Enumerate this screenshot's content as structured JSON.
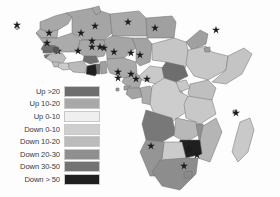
{
  "figure": {
    "type": "choropleth-map",
    "region": "Africa",
    "background_color": "#fdfdfd",
    "border_color": "#6e6e6e",
    "marker_color": "#1a1a1a"
  },
  "legend": {
    "name": "map-legend",
    "position": "lower-left",
    "entries": [
      {
        "label": "Up >20",
        "color": "#6e6e6e"
      },
      {
        "label": "Up 10-20",
        "color": "#a8a8a8"
      },
      {
        "label": "Up 0-10",
        "color": "#efefef"
      },
      {
        "label": "Down 0-10",
        "color": "#cfcfcf"
      },
      {
        "label": "Down 10-20",
        "color": "#bbbbbb"
      },
      {
        "label": "Down 20-30",
        "color": "#8f8f8f"
      },
      {
        "label": "Down 30-50",
        "color": "#737373"
      },
      {
        "label": "Down > 50",
        "color": "#1f1f1f"
      }
    ]
  },
  "chart_data": {
    "type": "heatmap",
    "title": "",
    "xlabel": "",
    "ylabel": "",
    "legend_position": "lower-left",
    "grid": false,
    "categories": [
      "Up >20",
      "Up 10-20",
      "Up 0-10",
      "Down 0-10",
      "Down 10-20",
      "Down 20-30",
      "Down 30-50",
      "Down > 50"
    ],
    "colors": [
      "#6e6e6e",
      "#a8a8a8",
      "#efefef",
      "#cfcfcf",
      "#bbbbbb",
      "#8f8f8f",
      "#737373",
      "#1f1f1f"
    ],
    "regions": [
      {
        "name": "Morocco",
        "category": "Up 10-20",
        "color": "#a8a8a8",
        "marker": false
      },
      {
        "name": "Western Sahara",
        "category": "Up 10-20",
        "color": "#b0b0b0",
        "marker": false
      },
      {
        "name": "Algeria",
        "category": "Up 10-20",
        "color": "#a5a5a5",
        "marker": true
      },
      {
        "name": "Tunisia",
        "category": "Up 10-20",
        "color": "#a5a5a5",
        "marker": false
      },
      {
        "name": "Libya",
        "category": "Up 10-20",
        "color": "#a8a8a8",
        "marker": true
      },
      {
        "name": "Egypt",
        "category": "Up 10-20",
        "color": "#a0a0a0",
        "marker": true
      },
      {
        "name": "Mauritania",
        "category": "Up 10-20",
        "color": "#ababab",
        "marker": true
      },
      {
        "name": "Cape Verde",
        "category": "Up 10-20",
        "color": "#b4b4b4",
        "marker": true
      },
      {
        "name": "Senegal",
        "category": "Up >20",
        "color": "#707070",
        "marker": true
      },
      {
        "name": "Gambia",
        "category": "Up >20",
        "color": "#6a6a6a",
        "marker": true
      },
      {
        "name": "Guinea-Bissau",
        "category": "Up >20",
        "color": "#767676",
        "marker": false
      },
      {
        "name": "Guinea",
        "category": "Down 10-20",
        "color": "#bdbdbd",
        "marker": true
      },
      {
        "name": "Sierra Leone",
        "category": "Down 10-20",
        "color": "#bdbdbd",
        "marker": false
      },
      {
        "name": "Liberia",
        "category": "Down 0-10",
        "color": "#cccccc",
        "marker": false
      },
      {
        "name": "Mali",
        "category": "Up 10-20",
        "color": "#a8a8a8",
        "marker": true
      },
      {
        "name": "Burkina Faso",
        "category": "Up >20",
        "color": "#6e6e6e",
        "marker": true
      },
      {
        "name": "Cote d'Ivoire",
        "category": "Down 10-20",
        "color": "#bababa",
        "marker": true
      },
      {
        "name": "Ghana",
        "category": "Down > 50",
        "color": "#1f1f1f",
        "marker": true
      },
      {
        "name": "Togo",
        "category": "Down 30-50",
        "color": "#6f6f6f",
        "marker": true
      },
      {
        "name": "Benin",
        "category": "Up 10-20",
        "color": "#a0a0a0",
        "marker": true
      },
      {
        "name": "Niger",
        "category": "Up 10-20",
        "color": "#a5a5a5",
        "marker": true
      },
      {
        "name": "Nigeria",
        "category": "Up 10-20",
        "color": "#aaaaaa",
        "marker": true
      },
      {
        "name": "Chad",
        "category": "Up 10-20",
        "color": "#a3a3a3",
        "marker": true
      },
      {
        "name": "Cameroon",
        "category": "Up 10-20",
        "color": "#a8a8a8",
        "marker": true
      },
      {
        "name": "Equatorial Guinea",
        "category": "Up 10-20",
        "color": "#9f9f9f",
        "marker": true
      },
      {
        "name": "Gabon",
        "category": "Up 10-20",
        "color": "#a4a4a4",
        "marker": true
      },
      {
        "name": "Sao Tome",
        "category": "Up 10-20",
        "color": "#9a9a9a",
        "marker": true
      },
      {
        "name": "Congo",
        "category": "Up 10-20",
        "color": "#adadad",
        "marker": true
      },
      {
        "name": "Central African Rep",
        "category": "Down 0-10",
        "color": "#c9c9c9",
        "marker": false
      },
      {
        "name": "Sudan",
        "category": "Down 0-10",
        "color": "#c6c6c6",
        "marker": false
      },
      {
        "name": "South Sudan",
        "category": "Up >20",
        "color": "#6e6e6e",
        "marker": false
      },
      {
        "name": "Eritrea",
        "category": "Up 10-20",
        "color": "#a0a0a0",
        "marker": true
      },
      {
        "name": "Ethiopia",
        "category": "Down 0-10",
        "color": "#c7c7c7",
        "marker": false
      },
      {
        "name": "Djibouti",
        "category": "Up 10-20",
        "color": "#9d9d9d",
        "marker": false
      },
      {
        "name": "Somalia",
        "category": "Down 0-10",
        "color": "#c4c4c4",
        "marker": false
      },
      {
        "name": "Kenya",
        "category": "Down 10-20",
        "color": "#bfbfbf",
        "marker": false
      },
      {
        "name": "Uganda",
        "category": "Down 0-10",
        "color": "#c8c8c8",
        "marker": false
      },
      {
        "name": "Rwanda",
        "category": "Down 0-10",
        "color": "#c2c2c2",
        "marker": false
      },
      {
        "name": "Burundi",
        "category": "Down 0-10",
        "color": "#c2c2c2",
        "marker": false
      },
      {
        "name": "Dem Rep Congo",
        "category": "Down 0-10",
        "color": "#cdcdcd",
        "marker": false
      },
      {
        "name": "Tanzania",
        "category": "Down 0-10",
        "color": "#c8c8c8",
        "marker": false
      },
      {
        "name": "Angola",
        "category": "Down 30-50",
        "color": "#787878",
        "marker": false
      },
      {
        "name": "Zambia",
        "category": "Down 10-20",
        "color": "#b8b8b8",
        "marker": false
      },
      {
        "name": "Malawi",
        "category": "Down 20-30",
        "color": "#909090",
        "marker": false
      },
      {
        "name": "Mozambique",
        "category": "Down 10-20",
        "color": "#b5b5b5",
        "marker": false
      },
      {
        "name": "Zimbabwe",
        "category": "Down > 50",
        "color": "#1f1f1f",
        "marker": true
      },
      {
        "name": "Botswana",
        "category": "Down 0-10",
        "color": "#cbcbcb",
        "marker": false
      },
      {
        "name": "Namibia",
        "category": "Down 20-30",
        "color": "#959595",
        "marker": true
      },
      {
        "name": "South Africa",
        "category": "Down 20-30",
        "color": "#8d8d8d",
        "marker": true
      },
      {
        "name": "Lesotho",
        "category": "Down 20-30",
        "color": "#8a8a8a",
        "marker": false
      },
      {
        "name": "Madagascar",
        "category": "Down 0-10",
        "color": "#c9c9c9",
        "marker": false
      },
      {
        "name": "Comoros",
        "category": "Up 10-20",
        "color": "#a0a0a0",
        "marker": true
      }
    ],
    "markers": {
      "symbol": "star",
      "count": 27,
      "points": [
        {
          "x": 17,
          "y": 25,
          "label": "Cape Verde"
        },
        {
          "x": 49,
          "y": 33,
          "label": "Senegal"
        },
        {
          "x": 47,
          "y": 43,
          "label": "Gambia"
        },
        {
          "x": 58,
          "y": 51,
          "label": "Guinea"
        },
        {
          "x": 81,
          "y": 33,
          "label": "Mali"
        },
        {
          "x": 95,
          "y": 26,
          "label": "Algeria"
        },
        {
          "x": 128,
          "y": 22,
          "label": "Libya"
        },
        {
          "x": 155,
          "y": 28,
          "label": "Egypt"
        },
        {
          "x": 92,
          "y": 41,
          "label": "Burkina Faso"
        },
        {
          "x": 78,
          "y": 51,
          "label": "Cote d'Ivoire"
        },
        {
          "x": 92,
          "y": 47,
          "label": "Ghana"
        },
        {
          "x": 100,
          "y": 47,
          "label": "Togo"
        },
        {
          "x": 104,
          "y": 48,
          "label": "Benin"
        },
        {
          "x": 114,
          "y": 52,
          "label": "Niger"
        },
        {
          "x": 131,
          "y": 53,
          "label": "Nigeria"
        },
        {
          "x": 140,
          "y": 55,
          "label": "Chad"
        },
        {
          "x": 118,
          "y": 72,
          "label": "Cameroon"
        },
        {
          "x": 131,
          "y": 74,
          "label": "Equatorial Guinea"
        },
        {
          "x": 136,
          "y": 79,
          "label": "Gabon"
        },
        {
          "x": 147,
          "y": 79,
          "label": "Congo"
        },
        {
          "x": 118,
          "y": 78,
          "label": "Sao Tome"
        },
        {
          "x": 216,
          "y": 30,
          "label": "Eritrea"
        },
        {
          "x": 236,
          "y": 113,
          "label": "Comoros"
        },
        {
          "x": 189,
          "y": 149,
          "label": "Zimbabwe"
        },
        {
          "x": 197,
          "y": 155,
          "label": "Mozambique"
        },
        {
          "x": 184,
          "y": 166,
          "label": "South Africa"
        },
        {
          "x": 151,
          "y": 146,
          "label": "Namibia"
        }
      ]
    }
  }
}
